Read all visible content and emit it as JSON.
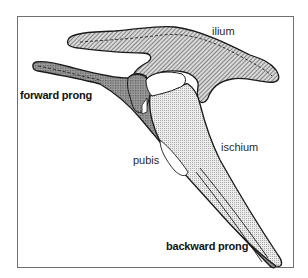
{
  "diagram": {
    "labels": {
      "ilium": "ilium",
      "forward_prong": "forward prong",
      "pubis": "pubis",
      "ischium": "ischium",
      "backward_prong": "backward prong"
    },
    "colors": {
      "outline": "#1a1a1a",
      "frame": "#6f6f6f",
      "ilium_hatch": "#555555",
      "pubis_fill": "#8a8a8a",
      "ischium_fill": "#d8d8d8",
      "background": "#ffffff"
    },
    "fills": {
      "ilium": "diagonal-hatch",
      "pubis": "crosshatch",
      "ischium": "fine-stipple"
    }
  }
}
